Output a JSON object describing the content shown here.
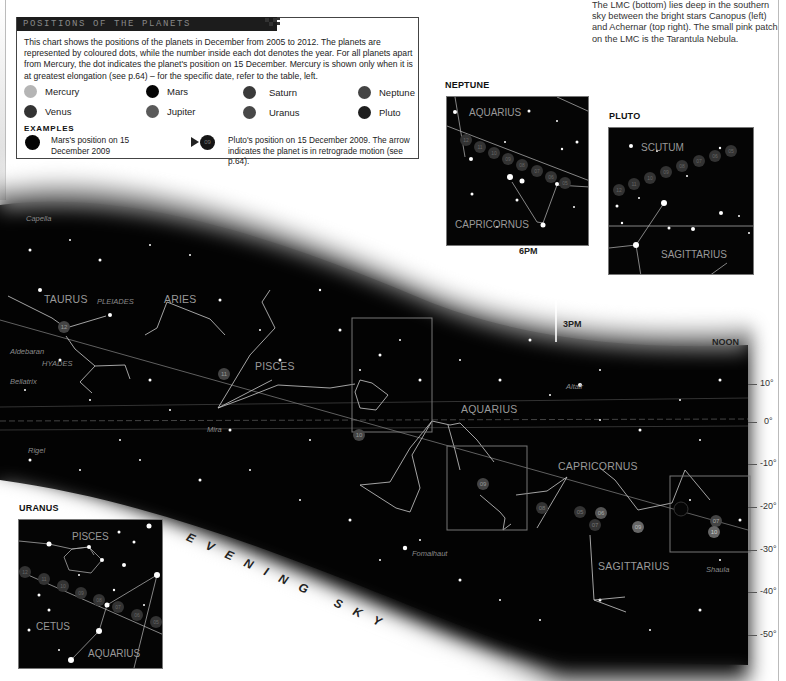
{
  "info_box": {
    "title": "POSITIONS OF THE PLANETS",
    "body": "This chart shows the positions of the planets in December from 2005 to 2012. The planets are represented by coloured dots, while the number inside each dot denotes the year. For all planets apart from Mercury, the dot indicates the planet's position on 15 December. Mercury is shown only when it is at greatest elongation (see p.64) – for the specific date, refer to the table, left.",
    "legend": [
      {
        "name": "Mercury",
        "color": "#b5b5b5"
      },
      {
        "name": "Mars",
        "color": "#050505"
      },
      {
        "name": "Saturn",
        "color": "#3a3a3a"
      },
      {
        "name": "Neptune",
        "color": "#444444"
      },
      {
        "name": "Venus",
        "color": "#333333"
      },
      {
        "name": "Jupiter",
        "color": "#5a5a5a"
      },
      {
        "name": "Uranus",
        "color": "#484848"
      },
      {
        "name": "Pluto",
        "color": "#1e1e1e"
      }
    ],
    "examples_title": "EXAMPLES",
    "example_mars": "Mars's position on 15 December 2009",
    "example_pluto_year": "09",
    "example_pluto": "Pluto's position on 15 December 2009. The arrow indicates the planet is in retrograde motion (see p.64)."
  },
  "caption_top_right": "The LMC (bottom) lies deep in the southern sky between the bright stars Canopus (left) and Achernar (top right). The small pink patch on the LMC is the Tarantula Nebula.",
  "insets": {
    "neptune": {
      "title": "NEPTUNE",
      "constellations": [
        "AQUARIUS",
        "CAPRICORNUS"
      ],
      "years": [
        "12",
        "11",
        "10",
        "09",
        "08",
        "07",
        "06",
        "05"
      ]
    },
    "pluto": {
      "title": "PLUTO",
      "constellations": [
        "SCUTUM",
        "SAGITTARIUS"
      ],
      "years": [
        "12",
        "11",
        "10",
        "09",
        "08",
        "07",
        "06",
        "05"
      ]
    },
    "uranus": {
      "title": "URANUS",
      "constellations": [
        "PISCES",
        "CETUS",
        "AQUARIUS"
      ],
      "years": [
        "12",
        "11",
        "10",
        "09",
        "08",
        "07",
        "06",
        "05"
      ]
    }
  },
  "time_labels": {
    "six_pm": "6PM",
    "three_pm": "3PM",
    "noon": "NOON"
  },
  "declination_labels": [
    "10°",
    "0°",
    "-10°",
    "-20°",
    "-30°",
    "-40°",
    "-50°"
  ],
  "constellations": [
    "TAURUS",
    "ARIES",
    "PISCES",
    "AQUARIUS",
    "CAPRICORNUS",
    "SAGITTARIUS"
  ],
  "stars": [
    "Capella",
    "PLEIADES",
    "Aldebaran",
    "HYADES",
    "Bellatrix",
    "Rigel",
    "Mira",
    "Altair",
    "Fomalhaut",
    "Shaula"
  ],
  "chart_markers": {
    "taurus_year": "12",
    "pisces_year": "11",
    "aquarius_year": "10",
    "aquarius_box_year": "09",
    "capricornus_years": [
      "08",
      "05",
      "06",
      "07"
    ],
    "sagittarius_years": [
      "09",
      "07",
      "10"
    ]
  },
  "evening_sky": "EVENING SKY"
}
